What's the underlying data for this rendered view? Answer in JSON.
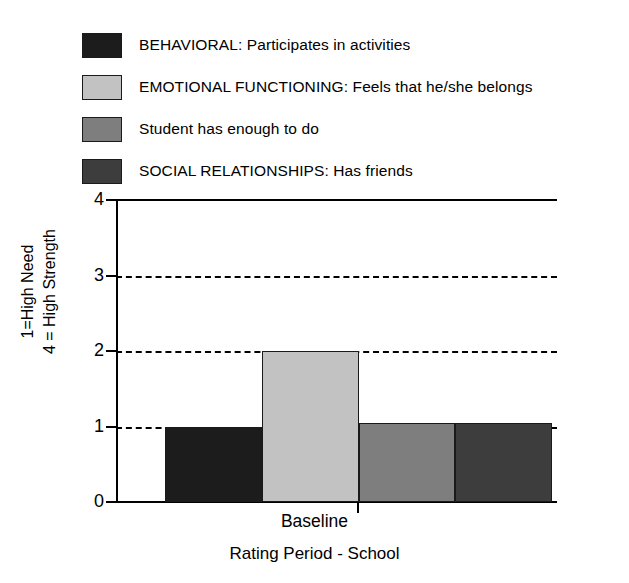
{
  "chart_data": {
    "type": "bar",
    "title": "",
    "xlabel": "Rating Period - School",
    "ylabel": "1=High Need\n4 = High Strength",
    "categories": [
      "Baseline"
    ],
    "xtick_labels": [
      "Baseline"
    ],
    "ytick_labels": [
      "0",
      "1",
      "2",
      "3",
      "4"
    ],
    "ylim": [
      0,
      4
    ],
    "yticks": [
      0,
      1,
      2,
      3,
      4
    ],
    "grid": "horizontal-dashed at 1, 2, 3",
    "legend_position": "above-plot",
    "series": [
      {
        "name": "BEHAVIORAL: Participates in activities",
        "values": [
          1.0
        ],
        "color": "#1c1c1c"
      },
      {
        "name": "EMOTIONAL FUNCTIONING: Feels that he/she belongs",
        "values": [
          2.0
        ],
        "color": "#c2c2c2"
      },
      {
        "name": "Student has enough to do",
        "values": [
          1.05
        ],
        "color": "#7e7e7e"
      },
      {
        "name": "SOCIAL RELATIONSHIPS: Has friends",
        "values": [
          1.05
        ],
        "color": "#3d3d3d"
      }
    ]
  },
  "legend": {
    "items": [
      {
        "label": "BEHAVIORAL: Participates in activities",
        "color": "#1c1c1c"
      },
      {
        "label": "EMOTIONAL FUNCTIONING: Feels that he/she belongs",
        "color": "#c2c2c2"
      },
      {
        "label": "Student has enough to do",
        "color": "#7e7e7e"
      },
      {
        "label": "SOCIAL RELATIONSHIPS: Has friends",
        "color": "#3d3d3d"
      }
    ]
  },
  "axes": {
    "y_title_line1": "1=High Need",
    "y_title_line2": "4 = High Strength",
    "x_title": "Rating Period - School",
    "x_tick_label": "Baseline",
    "y_tick_0": "0",
    "y_tick_1": "1",
    "y_tick_2": "2",
    "y_tick_3": "3",
    "y_tick_4": "4"
  }
}
